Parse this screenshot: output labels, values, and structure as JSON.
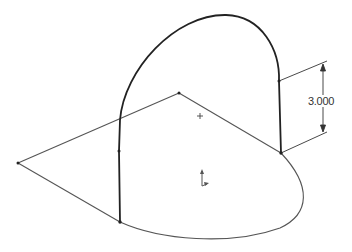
{
  "sketch": {
    "dimension": {
      "label": "3.000",
      "text_x": 308,
      "text_y": 96
    },
    "colors": {
      "background": "#ffffff",
      "sketch_line": "#555555",
      "arc_line": "#222222",
      "dimension": "#333333",
      "point": "#222222"
    },
    "points": [
      {
        "name": "left-vertex",
        "x": 18,
        "y": 163
      },
      {
        "name": "top-vertex",
        "x": 179,
        "y": 93
      },
      {
        "name": "right-corner",
        "x": 281,
        "y": 153
      },
      {
        "name": "right-vertical-top",
        "x": 279,
        "y": 81
      },
      {
        "name": "left-vertical-mid",
        "x": 119,
        "y": 151
      },
      {
        "name": "left-vertical-bottom",
        "x": 120,
        "y": 222
      }
    ],
    "markers": {
      "center_plus": {
        "x": 200,
        "y": 116
      },
      "origin": {
        "x": 202,
        "y": 178
      }
    }
  }
}
